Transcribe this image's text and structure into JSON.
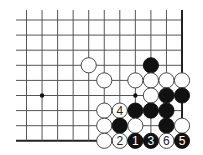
{
  "diagram": {
    "type": "go-board-fragment",
    "grid": {
      "columns": 11,
      "rows": 9,
      "origin_x": 26.5,
      "origin_y": 20,
      "spacing_x": 15.55,
      "spacing_y": 15.1,
      "line_extend_left": 16,
      "line_extend_top": 10,
      "edges": [
        "right",
        "bottom"
      ],
      "line_color": "#555555",
      "edge_color": "#222222"
    },
    "star_points": [
      {
        "col": 1,
        "row": 5
      },
      {
        "col": 7,
        "row": 5
      }
    ],
    "stones": [
      {
        "col": 4,
        "row": 3,
        "color": "white",
        "label": ""
      },
      {
        "col": 8,
        "row": 3,
        "color": "black",
        "label": ""
      },
      {
        "col": 5,
        "row": 4,
        "color": "white",
        "label": ""
      },
      {
        "col": 7,
        "row": 4,
        "color": "white",
        "label": ""
      },
      {
        "col": 8,
        "row": 4,
        "color": "white",
        "label": ""
      },
      {
        "col": 9,
        "row": 4,
        "color": "white",
        "label": ""
      },
      {
        "col": 10,
        "row": 4,
        "color": "white",
        "label": ""
      },
      {
        "col": 8,
        "row": 5,
        "color": "white",
        "label": ""
      },
      {
        "col": 9,
        "row": 5,
        "color": "black",
        "label": ""
      },
      {
        "col": 10,
        "row": 5,
        "color": "black",
        "label": ""
      },
      {
        "col": 5,
        "row": 6,
        "color": "white",
        "label": ""
      },
      {
        "col": 6,
        "row": 6,
        "color": "white",
        "label": "4"
      },
      {
        "col": 7,
        "row": 6,
        "color": "black",
        "label": ""
      },
      {
        "col": 8,
        "row": 6,
        "color": "black",
        "label": ""
      },
      {
        "col": 9,
        "row": 6,
        "color": "black",
        "label": ""
      },
      {
        "col": 5,
        "row": 7,
        "color": "white",
        "label": ""
      },
      {
        "col": 6,
        "row": 7,
        "color": "black",
        "label": ""
      },
      {
        "col": 7,
        "row": 7,
        "color": "white",
        "label": ""
      },
      {
        "col": 9,
        "row": 7,
        "color": "black",
        "label": ""
      },
      {
        "col": 10,
        "row": 7,
        "color": "white",
        "label": ""
      },
      {
        "col": 5,
        "row": 8,
        "color": "white",
        "label": ""
      },
      {
        "col": 6,
        "row": 8,
        "color": "white",
        "label": "2"
      },
      {
        "col": 7,
        "row": 8,
        "color": "black",
        "label": "1"
      },
      {
        "col": 8,
        "row": 8,
        "color": "black",
        "label": "3"
      },
      {
        "col": 9,
        "row": 8,
        "color": "white",
        "label": "6"
      },
      {
        "col": 10,
        "row": 8,
        "color": "black",
        "label": "5"
      }
    ],
    "stone_radius": 7.6,
    "colors": {
      "black_stone": "#111111",
      "white_stone": "#ffffff",
      "white_outline": "#333333",
      "label_on_black": "#ffffff",
      "label_on_white": "#222222"
    }
  }
}
